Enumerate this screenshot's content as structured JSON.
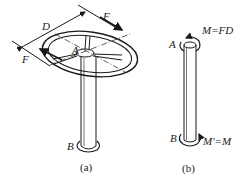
{
  "figure_a": {
    "caption": "(a)",
    "labels": {
      "diameter": "D",
      "force_top": "F",
      "force_left": "F",
      "point_a": "A",
      "point_b": "B"
    }
  },
  "figure_b": {
    "caption": "(b)",
    "labels": {
      "point_a": "A",
      "moment_top": "M=FD",
      "point_b": "B",
      "moment_bottom": "M′=M"
    }
  }
}
